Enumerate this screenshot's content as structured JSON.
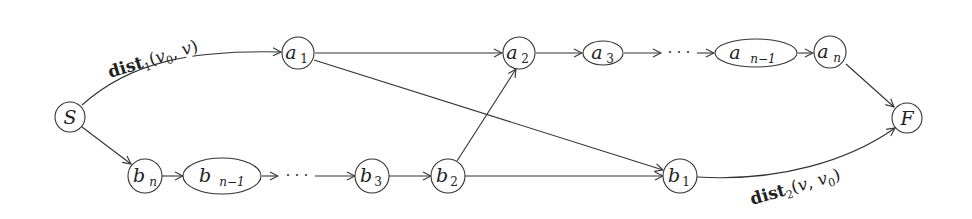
{
  "diagram": {
    "type": "directed-graph",
    "colors": {
      "stroke": "#333333",
      "background": "#ffffff",
      "text": "#222222"
    },
    "nodes": {
      "S": {
        "id": "S",
        "base": "S",
        "sub": "",
        "shape": "circle"
      },
      "a1": {
        "id": "a1",
        "base": "a",
        "sub": "1",
        "shape": "circle"
      },
      "a2": {
        "id": "a2",
        "base": "a",
        "sub": "2",
        "shape": "circle"
      },
      "a3": {
        "id": "a3",
        "base": "a",
        "sub": "3",
        "shape": "ellipse"
      },
      "an1": {
        "id": "a_{n-1}",
        "base": "a",
        "sub": "n−1",
        "shape": "ellipse"
      },
      "an": {
        "id": "a_n",
        "base": "a",
        "sub": "n",
        "shape": "circle"
      },
      "F": {
        "id": "F",
        "base": "F",
        "sub": "",
        "shape": "circle"
      },
      "bn": {
        "id": "b_n",
        "base": "b",
        "sub": "n",
        "shape": "circle"
      },
      "bn1": {
        "id": "b_{n-1}",
        "base": "b",
        "sub": "n−1",
        "shape": "ellipse"
      },
      "b3": {
        "id": "b3",
        "base": "b",
        "sub": "3",
        "shape": "circle"
      },
      "b2": {
        "id": "b2",
        "base": "b",
        "sub": "2",
        "shape": "circle"
      },
      "b1": {
        "id": "b1",
        "base": "b",
        "sub": "1",
        "shape": "circle"
      }
    },
    "ellipsis": "· · ·",
    "edges": [
      {
        "from": "S",
        "to": "a1",
        "label": "dist1(v0,v)"
      },
      {
        "from": "a1",
        "to": "a2",
        "label": ""
      },
      {
        "from": "a1",
        "to": "b1",
        "label": ""
      },
      {
        "from": "a2",
        "to": "a3",
        "label": ""
      },
      {
        "from": "a3",
        "to": "an1",
        "label": "",
        "via": "···"
      },
      {
        "from": "an1",
        "to": "an",
        "label": ""
      },
      {
        "from": "an",
        "to": "F",
        "label": ""
      },
      {
        "from": "S",
        "to": "bn",
        "label": ""
      },
      {
        "from": "bn",
        "to": "bn1",
        "label": ""
      },
      {
        "from": "bn1",
        "to": "b3",
        "label": "",
        "via": "···"
      },
      {
        "from": "b3",
        "to": "b2",
        "label": ""
      },
      {
        "from": "b2",
        "to": "a2",
        "label": ""
      },
      {
        "from": "b2",
        "to": "b1",
        "label": ""
      },
      {
        "from": "b1",
        "to": "F",
        "label": "dist2(v,v0)"
      }
    ],
    "edge_labels": {
      "top": {
        "bold": "dist",
        "sub": "1",
        "args_open": "(",
        "arg1": "v",
        "arg1_sub": "0",
        "sep": ", ",
        "arg2": "v",
        "args_close": ")"
      },
      "bottom": {
        "bold": "dist",
        "sub": "2",
        "args_open": "(",
        "arg1": "v",
        "sep": ", ",
        "arg2": "v",
        "arg2_sub": "0",
        "args_close": ")"
      }
    }
  }
}
